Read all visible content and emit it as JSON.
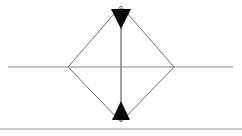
{
  "canvas": {
    "width": 242,
    "height": 136,
    "background_color": "#ffffff",
    "title": "Diamond section with vertical dimension arrows"
  },
  "colors": {
    "outline_stroke": "#6e6e6e",
    "axis_stroke": "#8a8a8a",
    "dimension_line_stroke": "#7a7a7a",
    "arrowhead_fill": "#0a0a0a",
    "baseline_stroke": "#9a9a9a"
  },
  "shapes": {
    "diamond": {
      "name": "diamond-outline",
      "description": "Unfilled rhombus outline",
      "fill": "none",
      "stroke_width": 1,
      "vertices": {
        "top": [
          121,
          6
        ],
        "right": [
          174,
          67
        ],
        "bottom": [
          121,
          122
        ],
        "left": [
          68,
          67
        ]
      }
    },
    "horizontal_axis": {
      "name": "horizontal-axis-line",
      "description": "Horizontal centerline crossing the diamond at its widest points",
      "x1": 8,
      "y1": 67,
      "x2": 233,
      "y2": 67,
      "stroke_width": 1
    },
    "vertical_dimension_line": {
      "name": "vertical-dimension-line",
      "description": "Vertical line running from top vertex to bottom vertex",
      "x1": 121,
      "y1": 8,
      "x2": 121,
      "y2": 121,
      "stroke_width": 1.4
    },
    "baseline": {
      "name": "bottom-baseline",
      "description": "Horizontal rule near the bottom edge spanning full width",
      "x1": 0,
      "y1": 129,
      "x2": 242,
      "y2": 129,
      "stroke_width": 1
    }
  },
  "arrowheads": [
    {
      "name": "top-arrowhead",
      "direction": "down",
      "description": "Filled triangle pointing downward, apex below the diamond top vertex",
      "points": "111,9 131,9 121,29"
    },
    {
      "name": "bottom-arrowhead",
      "direction": "up",
      "description": "Filled triangle pointing upward, apex above the diamond bottom vertex",
      "points": "112,120 130,120 121,101"
    }
  ]
}
